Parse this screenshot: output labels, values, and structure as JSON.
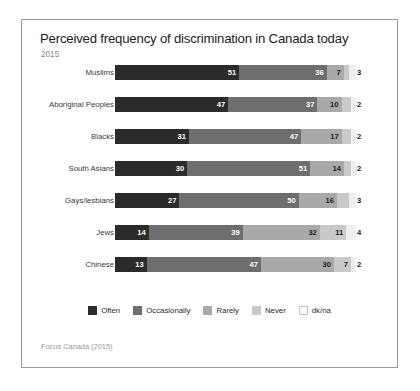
{
  "chart": {
    "title": "Perceived frequency of discrimination in Canada today",
    "subtitle": "2015",
    "source": "Focus Canada (2015)"
  },
  "chart_data": {
    "type": "bar",
    "subtype": "horizontal-stacked",
    "title": "Perceived frequency of discrimination in Canada today",
    "subtitle": "2015",
    "xlabel": "",
    "ylabel": "",
    "xlim": [
      0,
      100
    ],
    "grid": false,
    "legend_position": "bottom",
    "categories": [
      "Muslims",
      "Aboriginal Peoples",
      "Blacks",
      "South Asians",
      "Gays/lesbians",
      "Jews",
      "Chinese"
    ],
    "series": [
      {
        "name": "Often",
        "color": "#2b2b2b",
        "values": [
          51,
          47,
          31,
          30,
          27,
          14,
          13
        ]
      },
      {
        "name": "Occasionally",
        "color": "#6e6e6e",
        "values": [
          36,
          37,
          47,
          51,
          50,
          39,
          47
        ]
      },
      {
        "name": "Rarely",
        "color": "#a9a9a9",
        "values": [
          7,
          10,
          17,
          14,
          16,
          32,
          30
        ]
      },
      {
        "name": "Never",
        "color": "#c9c9c9",
        "values": [
          2,
          4,
          4,
          3,
          5,
          11,
          7
        ]
      },
      {
        "name": "dk/na",
        "color": "#efefef",
        "values": [
          3,
          2,
          2,
          2,
          3,
          4,
          2
        ]
      }
    ],
    "annotation": "Focus Canada (2015)"
  },
  "legend": [
    {
      "label": "Often"
    },
    {
      "label": "Occasionally"
    },
    {
      "label": "Rarely"
    },
    {
      "label": "Never"
    },
    {
      "label": "dk/na"
    }
  ]
}
